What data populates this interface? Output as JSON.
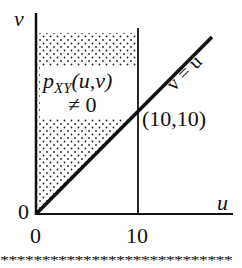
{
  "diagram": {
    "type": "region-plot",
    "axes": {
      "x_label": "u",
      "y_label": "v",
      "x_ticks": [
        "0",
        "10"
      ],
      "y_ticks": [
        "0"
      ]
    },
    "region": {
      "label_main": "p",
      "label_sub": "XY",
      "label_args": "(u,v)",
      "label_cond": "≠ 0",
      "description": "Shaded region between v-axis, u=10 and v=u (v > u, 0 < u < 10)"
    },
    "line": {
      "label": "v = u"
    },
    "point": {
      "label": "(10,10)"
    },
    "footer_stars": "****************************"
  }
}
